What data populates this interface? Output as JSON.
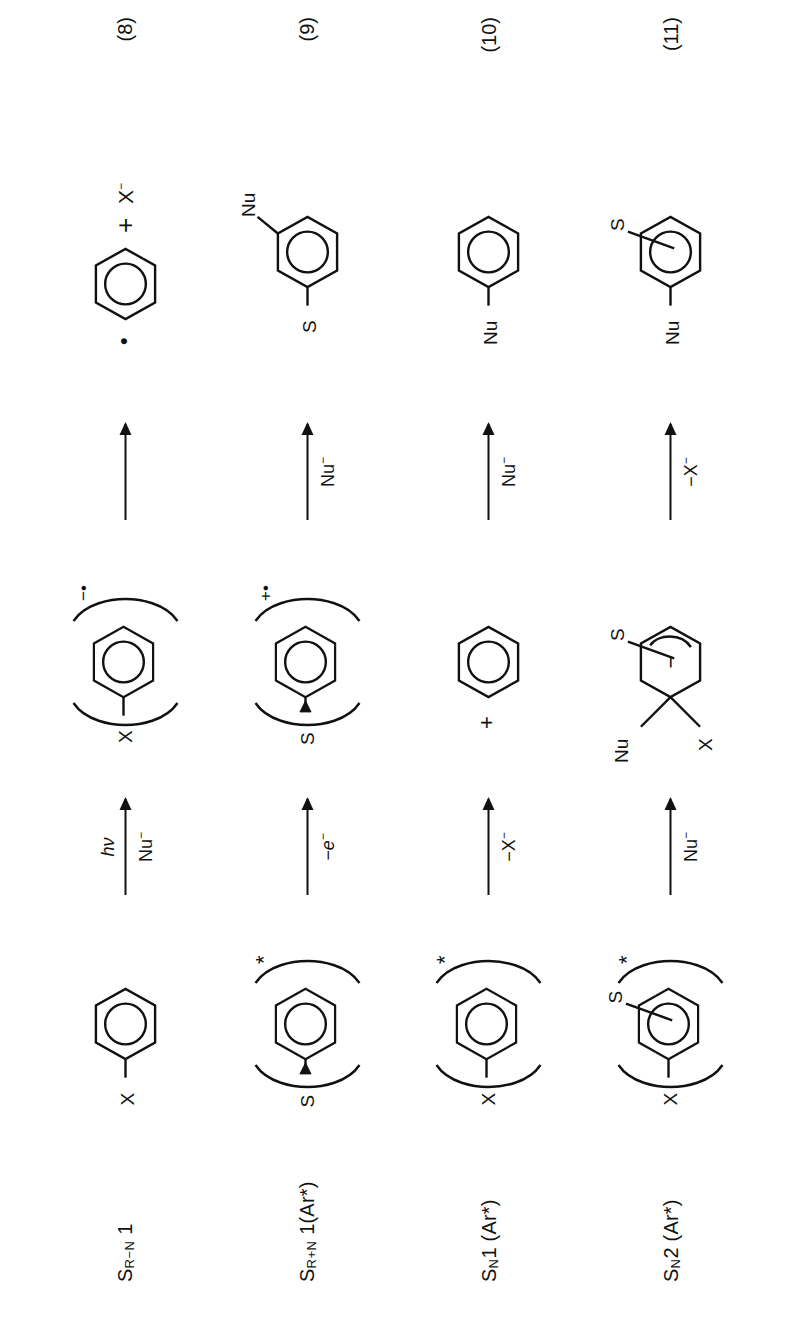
{
  "figure": {
    "kind": "reaction-scheme",
    "orientation": "rotated-90-ccw",
    "ink_color": "#111111",
    "background_color": "#ffffff",
    "title": ""
  },
  "symbols": {
    "plus": "+",
    "minus": "−",
    "radical_dot": "•",
    "star": "*",
    "anion_X": "X",
    "anion_charge": "−",
    "ring_minus": "−"
  },
  "rows": [
    {
      "name_main": "S",
      "name_sub": "R−N",
      "name_tail": " 1",
      "name_full": "Sʀ₋ɴ 1",
      "eq_number": "(8)",
      "start": {
        "type": "benzene",
        "substituents": [
          {
            "label": "X",
            "position": "left"
          }
        ],
        "bracket": false,
        "charge": "",
        "excited": false
      },
      "arrow1": {
        "above": "hν",
        "below": "Nu",
        "below_sup": "−",
        "above_italic": true
      },
      "intermediate": {
        "type": "benzene",
        "substituents": [
          {
            "label": "X",
            "position": "left"
          }
        ],
        "bracket": true,
        "charge": "−•",
        "excited": false
      },
      "arrow2": {
        "above": "",
        "below": "",
        "below_sup": ""
      },
      "product": {
        "type": "benzene-radical-plus-anion",
        "radical_dot": "•",
        "join": "+",
        "anion_text": "X",
        "anion_sup": "−",
        "substituents": []
      }
    },
    {
      "name_main": "S",
      "name_sub": "R+N",
      "name_tail": " 1(Ar*)",
      "name_full": "Sʀ₊ɴ 1(Ar*)",
      "eq_number": "(9)",
      "start": {
        "type": "benzene",
        "substituents": [
          {
            "label": "S",
            "position": "left-dative"
          }
        ],
        "bracket": true,
        "charge": "",
        "excited": true
      },
      "arrow1": {
        "above": "",
        "below": "−e",
        "below_sup": "−",
        "below_italic": true
      },
      "intermediate": {
        "type": "benzene",
        "substituents": [
          {
            "label": "S",
            "position": "left-dative"
          }
        ],
        "bracket": true,
        "charge": "+•",
        "excited": false
      },
      "arrow2": {
        "above": "",
        "below": "Nu",
        "below_sup": "−"
      },
      "product": {
        "type": "benzene",
        "substituents": [
          {
            "label": "S",
            "position": "left"
          },
          {
            "label": "Nu",
            "position": "upper-right"
          }
        ]
      }
    },
    {
      "name_main": "S",
      "name_sub": "N",
      "name_tail": "1 (Ar*)",
      "name_full": "Sɴ 1 (Ar*)",
      "eq_number": "(10)",
      "start": {
        "type": "benzene",
        "substituents": [
          {
            "label": "X",
            "position": "left"
          }
        ],
        "bracket": true,
        "charge": "",
        "excited": true
      },
      "arrow1": {
        "above": "",
        "below": "−X",
        "below_sup": "−"
      },
      "intermediate": {
        "type": "benzene",
        "substituents": [],
        "bracket": false,
        "charge": "+",
        "charge_side": "left",
        "excited": false
      },
      "arrow2": {
        "above": "",
        "below": "Nu",
        "below_sup": "−"
      },
      "product": {
        "type": "benzene",
        "substituents": [
          {
            "label": "Nu",
            "position": "left"
          }
        ]
      }
    },
    {
      "name_main": "S",
      "name_sub": "N",
      "name_tail": "2 (Ar*)",
      "name_full": "Sɴ 2 (Ar*)",
      "eq_number": "(11)",
      "start": {
        "type": "benzene",
        "substituents": [
          {
            "label": "X",
            "position": "left"
          },
          {
            "label": "S",
            "position": "upper-right"
          }
        ],
        "bracket": true,
        "charge": "",
        "excited": true
      },
      "arrow1": {
        "above": "",
        "below": "Nu",
        "below_sup": "−"
      },
      "intermediate": {
        "type": "meisenheimer",
        "substituents": [
          {
            "label": "Nu",
            "position": "upper-left"
          },
          {
            "label": "X",
            "position": "lower-left"
          },
          {
            "label": "S",
            "position": "upper-right"
          }
        ],
        "bracket": false,
        "charge": "−",
        "charge_inside_ring": true,
        "excited": false
      },
      "arrow2": {
        "above": "",
        "below": "−X",
        "below_sup": "−"
      },
      "product": {
        "type": "benzene",
        "substituents": [
          {
            "label": "Nu",
            "position": "left"
          },
          {
            "label": "S",
            "position": "upper-right"
          }
        ]
      }
    }
  ]
}
